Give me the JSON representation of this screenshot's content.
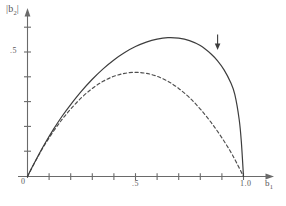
{
  "figure": {
    "axes": {
      "y_axis_label": "|b2|",
      "y_axis_label_base": "|b",
      "y_axis_label_sub": "2",
      "y_axis_label_tail": "|",
      "x_axis_label_base": "b",
      "x_axis_label_sub": "1"
    },
    "tick_labels": {
      "y_half": ".5",
      "x_zero": "0",
      "x_half": ".5",
      "x_one": "1.0"
    },
    "annotation": {
      "name": "down-arrow-marker",
      "glyph": "↓"
    },
    "colors": {
      "ink": "#4a4a4a",
      "curve_solid": "#3d3d3d",
      "curve_dashed": "#4f4f4f",
      "axis": "#5a5a5a",
      "background": "#ffffff"
    }
  },
  "chart_data": {
    "type": "line",
    "title": "",
    "xlabel": "b1",
    "ylabel": "|b2|",
    "xlim": [
      0,
      1.08
    ],
    "ylim": [
      0,
      0.72
    ],
    "grid": false,
    "legend": "none",
    "x_ticks": [
      0,
      0.1,
      0.2,
      0.3,
      0.4,
      0.5,
      0.6,
      0.7,
      0.8,
      0.9,
      1.0
    ],
    "x_tick_labels": [
      "0",
      "",
      "",
      "",
      "",
      ".5",
      "",
      "",
      "",
      "",
      "1.0"
    ],
    "y_ticks": [
      0,
      0.1,
      0.2,
      0.3,
      0.4,
      0.5,
      0.6
    ],
    "y_tick_labels": [
      "",
      "",
      "",
      "",
      "",
      ".5",
      ""
    ],
    "annotations": [
      {
        "text": "↓",
        "x": 0.88,
        "y": 0.54
      }
    ],
    "series": [
      {
        "name": "solid-boundary",
        "style": "solid",
        "x": [
          0.0,
          0.02,
          0.05,
          0.08,
          0.12,
          0.16,
          0.2,
          0.25,
          0.3,
          0.35,
          0.4,
          0.45,
          0.5,
          0.55,
          0.6,
          0.65,
          0.7,
          0.75,
          0.8,
          0.85,
          0.88,
          0.91,
          0.94,
          0.96,
          0.98,
          0.99,
          1.0
        ],
        "y": [
          0.0,
          0.035,
          0.085,
          0.132,
          0.19,
          0.243,
          0.29,
          0.344,
          0.392,
          0.434,
          0.47,
          0.5,
          0.524,
          0.542,
          0.554,
          0.56,
          0.558,
          0.548,
          0.528,
          0.494,
          0.466,
          0.43,
          0.38,
          0.33,
          0.23,
          0.14,
          0.0
        ]
      },
      {
        "name": "dashed-boundary",
        "style": "dashed",
        "x": [
          0.0,
          0.02,
          0.05,
          0.08,
          0.12,
          0.16,
          0.2,
          0.25,
          0.3,
          0.35,
          0.4,
          0.45,
          0.5,
          0.55,
          0.6,
          0.65,
          0.7,
          0.75,
          0.8,
          0.85,
          0.9,
          0.95,
          1.0
        ],
        "y": [
          0.0,
          0.034,
          0.083,
          0.128,
          0.182,
          0.23,
          0.272,
          0.318,
          0.355,
          0.384,
          0.404,
          0.416,
          0.42,
          0.416,
          0.404,
          0.384,
          0.355,
          0.318,
          0.272,
          0.218,
          0.156,
          0.085,
          0.0
        ]
      }
    ]
  }
}
